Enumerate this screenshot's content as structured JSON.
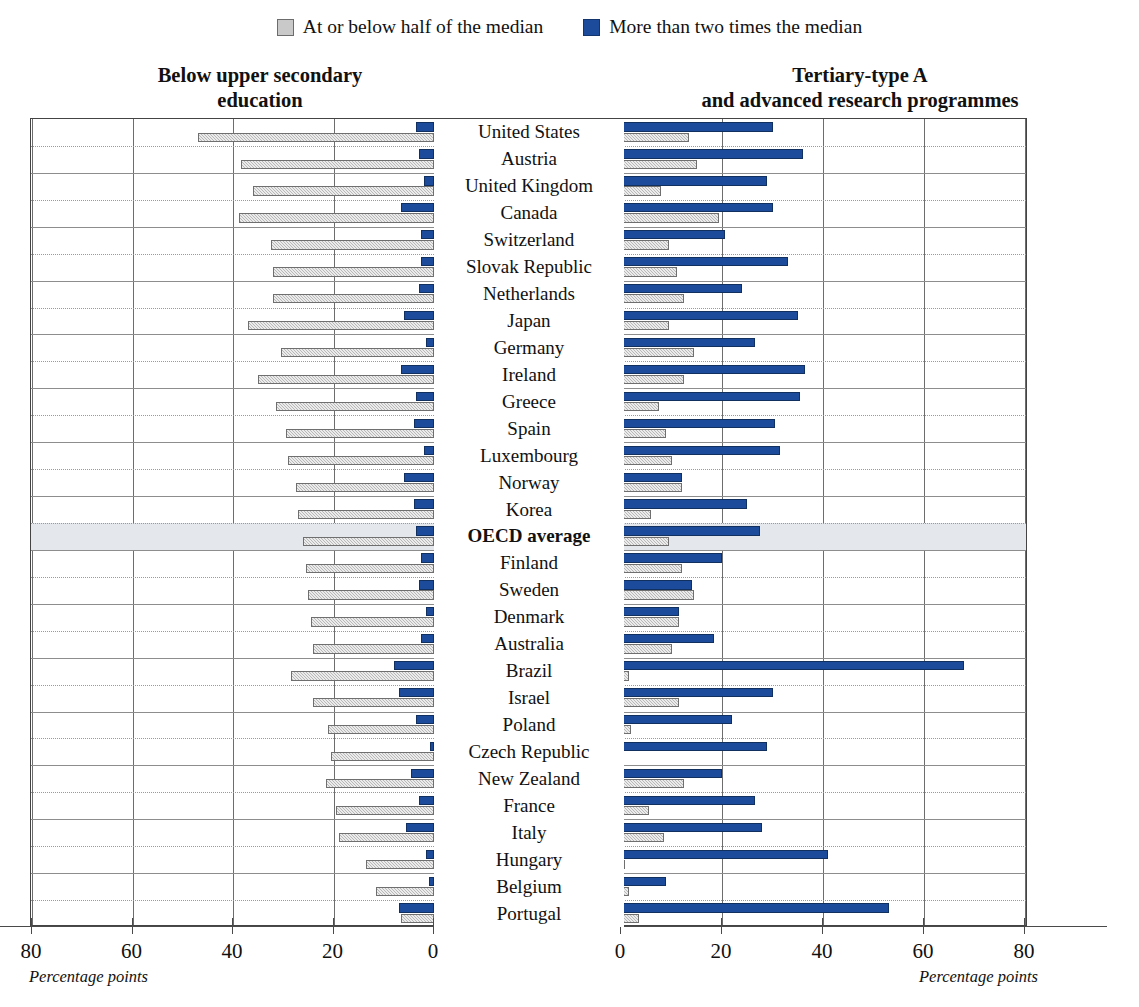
{
  "legend": {
    "items": [
      {
        "label": "At or below half of the median",
        "color": "#c9c9c9",
        "icon": "gray-square-swatch"
      },
      {
        "label": "More than two times the median",
        "color": "#1c4b9c",
        "icon": "blue-square-swatch"
      }
    ]
  },
  "panels": {
    "left": {
      "title": "Below upper secondary\neducation",
      "axis_label": "Percentage points",
      "ticks": [
        80,
        60,
        40,
        20,
        0
      ]
    },
    "right": {
      "title": "Tertiary-type A\nand advanced research programmes",
      "axis_label": "Percentage points",
      "ticks": [
        0,
        20,
        40,
        60,
        80
      ]
    }
  },
  "chart_data": {
    "type": "bar",
    "orientation": "horizontal",
    "layout": "diverging-double-panel",
    "xlabel": "Percentage points",
    "ylabel": "",
    "xlim_left": [
      0,
      80
    ],
    "xlim_right": [
      0,
      80
    ],
    "grid": true,
    "legend_position": "top-center",
    "categories": [
      "United States",
      "Austria",
      "United Kingdom",
      "Canada",
      "Switzerland",
      "Slovak Republic",
      "Netherlands",
      "Japan",
      "Germany",
      "Ireland",
      "Greece",
      "Spain",
      "Luxembourg",
      "Norway",
      "Korea",
      "OECD average",
      "Finland",
      "Sweden",
      "Denmark",
      "Australia",
      "Brazil",
      "Israel",
      "Poland",
      "Czech Republic",
      "New Zealand",
      "France",
      "Italy",
      "Hungary",
      "Belgium",
      "Portugal"
    ],
    "series": [
      {
        "name": "At or below half of the median",
        "panel": "left",
        "color": "#c9c9c9",
        "values": [
          47.0,
          38.5,
          36.0,
          38.8,
          32.5,
          32.0,
          32.0,
          37.0,
          30.5,
          35.0,
          31.5,
          29.5,
          29.0,
          27.5,
          27.0,
          26.0,
          25.5,
          25.0,
          24.5,
          24.0,
          28.5,
          24.0,
          21.0,
          20.5,
          21.5,
          19.5,
          19.0,
          13.5,
          11.5,
          6.5
        ]
      },
      {
        "name": "More than two times the median",
        "panel": "left",
        "color": "#1c4b9c",
        "values": [
          3.5,
          3.0,
          2.0,
          6.5,
          2.5,
          2.5,
          3.0,
          6.0,
          1.5,
          6.5,
          3.5,
          4.0,
          2.0,
          6.0,
          4.0,
          3.5,
          2.5,
          3.0,
          1.5,
          2.5,
          8.0,
          7.0,
          3.5,
          0.7,
          4.5,
          3.0,
          5.5,
          1.5,
          1.0,
          7.0
        ]
      },
      {
        "name": "More than two times the median",
        "panel": "right",
        "color": "#1c4b9c",
        "values": [
          30.0,
          36.0,
          29.0,
          30.0,
          20.5,
          33.0,
          24.0,
          35.0,
          26.5,
          36.5,
          35.5,
          30.5,
          31.5,
          12.0,
          25.0,
          27.5,
          20.0,
          14.0,
          11.5,
          18.5,
          68.0,
          30.0,
          22.0,
          29.0,
          20.0,
          26.5,
          28.0,
          41.0,
          9.0,
          53.0
        ]
      },
      {
        "name": "At or below half of the median",
        "panel": "right",
        "color": "#c9c9c9",
        "values": [
          13.5,
          15.0,
          8.0,
          19.5,
          9.5,
          11.0,
          12.5,
          9.5,
          14.5,
          12.5,
          7.5,
          9.0,
          10.0,
          12.0,
          6.0,
          9.5,
          12.0,
          14.5,
          11.5,
          10.0,
          1.5,
          11.5,
          2.0,
          0.5,
          12.5,
          5.5,
          8.5,
          0.8,
          1.5,
          3.5
        ]
      }
    ]
  }
}
